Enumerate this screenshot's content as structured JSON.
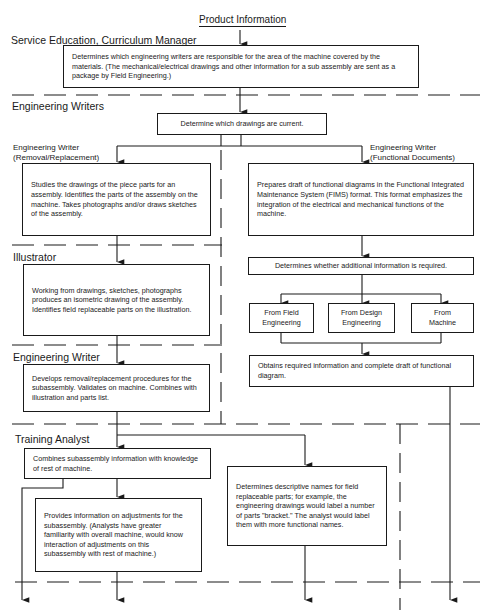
{
  "title": "Product Information",
  "lanes": {
    "curriculum_manager": "Service Education, Curriculum Manager",
    "engineering_writers": "Engineering Writers",
    "illustrator": "Illustrator",
    "engineering_writer": "Engineering Writer",
    "training_analyst": "Training Analyst"
  },
  "sublabels": {
    "removal_replacement": "Engineering Writer\n(Removal/Replacement)",
    "functional_documents": "Engineering Writer\n(Functional Documents)"
  },
  "boxes": {
    "determine_writers": "Determines which engineering writers are responsible for the area of the machine covered by the materials. (The mechanical/electrical drawings and other information for a sub assembly are sent as a package by Field Engineering.)",
    "current_drawings": "Determine which drawings are current.",
    "studies_drawings": "Studies the drawings of the piece parts for an assembly. Identifies the parts of the assembly on the machine. Takes photographs and/or draws sketches of the assembly.",
    "prepares_draft": "Prepares draft of functional diagrams in the Functional Integrated Maintenance System (FIMS) format. This format emphasizes the integration of the electrical and mechanical functions of the machine.",
    "additional_info": "Determines whether additional information is required.",
    "from_field": "From Field Engineering",
    "from_design": "From Design Engineering",
    "from_machine": "From Machine",
    "obtains_info": "Obtains required information and complete draft of functional diagram.",
    "isometric": "Working from drawings, sketches, photographs produces an isometric drawing of the assembly. Identifies field replaceable parts on the illustration.",
    "procedures": "Develops removal/replacement procedures for the subassembly. Validates on machine. Combines with illustration and parts list.",
    "combines": "Combines subassembly information with knowledge of rest of machine.",
    "adjustments": "Provides information on adjustments for the subassembly. (Analysts have greater familiarity with overall machine, would know interaction of adjustments on this subassembly with rest of machine.)",
    "descriptive_names": "Determines descriptive names for field replaceable parts; for example, the engineering drawings would label a number of parts \"bracket.\" The analyst would label them with more functional names."
  }
}
